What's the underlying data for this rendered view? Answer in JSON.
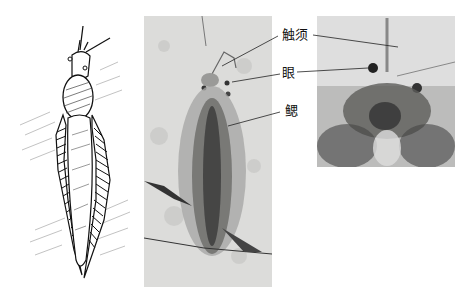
{
  "figure": {
    "panels": [
      {
        "id": "drawing",
        "description": "line-drawing reconstruction of elongated arthropod with feathery gill rows"
      },
      {
        "id": "photo-full",
        "description": "fossil photograph, full body"
      },
      {
        "id": "photo-head",
        "description": "fossil photograph, head close-up"
      }
    ],
    "labels": {
      "antennae": "触须",
      "eye": "眼",
      "gill": "鳃"
    },
    "colors": {
      "background": "#ffffff",
      "ink": "#111111",
      "rock": "#d9d9d7",
      "fossil_dark": "#3a3a3a"
    }
  }
}
